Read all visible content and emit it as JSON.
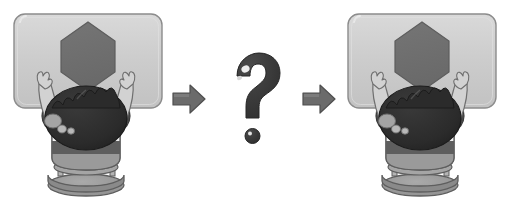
{
  "illustration": {
    "title": "Child seated at table with hexagon shape, question mark transition",
    "style": "grayscale-cartoon",
    "background_color": "#ffffff",
    "canvas": {
      "width": 510,
      "height": 206
    }
  },
  "palette": {
    "table_fill": "#c9c9c9",
    "table_fill_light": "#d6d6d6",
    "table_border": "#8c8c8c",
    "hexagon_fill": "#6e6e6e",
    "hexagon_stroke": "#5a5a5a",
    "skin": "#d2d2d2",
    "skin_shadow": "#a9a9a9",
    "skin_outline": "#6f6f6f",
    "hair_dark": "#2b2b2b",
    "hair_mid": "#3d3d3d",
    "shirt_dark": "#4b4b4b",
    "shirt_white": "#f0f0f0",
    "shirt_mid": "#9a9a9a",
    "chair_fill": "#9e9e9e",
    "chair_shadow": "#7d7d7d",
    "chair_outline": "#5e5e5e",
    "arrow_fill": "#6b6b6b",
    "arrow_stroke": "#4f4f4f",
    "qmark_fill": "#3a3a3a",
    "qmark_highlight": "#e8e8e8"
  },
  "panels": [
    {
      "id": "panel-before",
      "label": "Before: child at table facing hexagon",
      "position": "left",
      "table": {
        "shape": "rounded-rectangle",
        "label": "table"
      },
      "object": {
        "shape": "hexagon",
        "label": "hexagon block"
      },
      "figure": {
        "label": "child seen from behind",
        "hair": "dark curly hair",
        "shirt": "horizontally striped shirt",
        "seat": "round stool",
        "arms": "both arms raised toward table"
      }
    },
    {
      "id": "panel-after",
      "label": "After: child at table facing hexagon",
      "position": "right",
      "table": {
        "shape": "rounded-rectangle",
        "label": "table"
      },
      "object": {
        "shape": "hexagon",
        "label": "hexagon block"
      },
      "figure": {
        "label": "child seen from behind",
        "hair": "dark curly hair",
        "shirt": "horizontally striped shirt",
        "seat": "round stool",
        "arms": "both arms raised toward table"
      }
    }
  ],
  "connectors": [
    {
      "id": "arrow-1",
      "label": "right arrow",
      "direction": "right"
    },
    {
      "id": "arrow-2",
      "label": "right arrow",
      "direction": "right"
    }
  ],
  "center": {
    "symbol": "?",
    "label": "question mark",
    "description": "glossy question mark with separate round dot below"
  }
}
